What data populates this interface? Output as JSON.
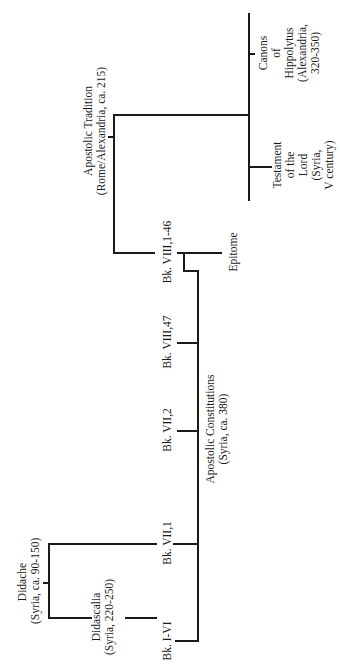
{
  "diagram": {
    "orientation": "rotated-90-ccw",
    "nodes": {
      "didache": {
        "name": "Didache",
        "meta": "(Syria, ca. 90-150)"
      },
      "didascalia": {
        "name": "Didascalia",
        "meta": "(Syria, 220-250)"
      },
      "apostolic_constitutions": {
        "name": "Apostolic Constitutions",
        "meta": "(Syria, ca. 380)"
      },
      "apostolic_tradition": {
        "name": "Apostolic Tradition",
        "meta": "(Rome/Alexandria, ca. 215)"
      },
      "epitome": {
        "name": "Epitome"
      },
      "canons_of_hippolytus": {
        "lines": [
          "Canons",
          "of",
          "Hippolytus",
          "(Alexandria,",
          "320-350)"
        ]
      },
      "testament_of_the_lord": {
        "lines": [
          "Testament",
          "of the",
          "Lord",
          "(Syria,",
          "V century)"
        ]
      }
    },
    "books": [
      {
        "label": "Bk. I-VI"
      },
      {
        "label": "Bk. VII,1"
      },
      {
        "label": "Bk. VII,2"
      },
      {
        "label": "Bk. VIII,47"
      },
      {
        "label": "Bk. VIII,1-46"
      }
    ]
  }
}
